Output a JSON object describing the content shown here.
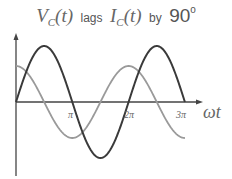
{
  "title": {
    "v_symbol": "V",
    "v_sub": "C",
    "v_arg": "(t)",
    "verb": "lags",
    "i_symbol": "I",
    "i_sub": "C",
    "i_arg": "(t)",
    "by": "by",
    "angle": "90",
    "degree": "o"
  },
  "axes": {
    "x_label": "ωt",
    "ticks": [
      "π",
      "2π",
      "3π"
    ]
  },
  "colors": {
    "voltage_curve": "#3a3a3a",
    "current_curve": "#9a9a9a",
    "axis": "#444444"
  }
}
